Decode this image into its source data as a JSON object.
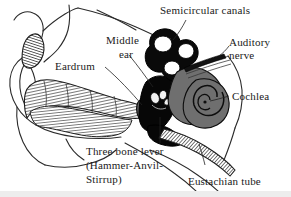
{
  "figure": {
    "background_color": "#ffffff",
    "ink_color": "#1a1a1a",
    "bottom_strip_color": "#ededed",
    "width": 291,
    "height": 197
  },
  "labels": {
    "semicircular_canals": "Semicircular canals",
    "auditory_nerve_line1": "Auditory",
    "auditory_nerve_line2": "nerve",
    "cochlea": "Cochlea",
    "middle_ear_line1": "Middle",
    "middle_ear_line2": "ear",
    "eardrum": "Eardrum",
    "three_bone_lever_line1": "Three bone lever",
    "three_bone_lever_line2": "(Hammer-Anvil-",
    "three_bone_lever_line3": "Stirrup)",
    "eustachian_tube": "Eustachian tube"
  },
  "structures": {
    "pinna": "outer-ear-pinna",
    "ear_canal": "external-auditory-canal",
    "eardrum": "tympanic-membrane",
    "ossicles": "ossicles-hammer-anvil-stirrup",
    "semicircular_canals": "semicircular-canals",
    "vestibule": "vestibule",
    "cochlea": "cochlea-spiral",
    "auditory_nerve": "auditory-nerve-bundle",
    "eustachian_tube": "eustachian-tube"
  },
  "colors": {
    "black_ink": "#1a1a1a",
    "dark_structure": "#000000",
    "gray_structure": "#6e6e6e",
    "mid_gray": "#585858",
    "light_gray": "#9a9a9a",
    "hatch": "#333333"
  }
}
